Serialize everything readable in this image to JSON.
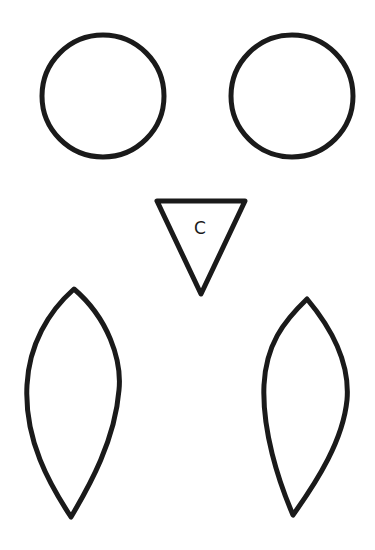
{
  "diagram": {
    "shapes": [
      {
        "id": "left-eye",
        "type": "circle",
        "cx": 103,
        "cy": 96,
        "r": 62
      },
      {
        "id": "right-eye",
        "type": "circle",
        "cx": 292,
        "cy": 96,
        "r": 62
      },
      {
        "id": "beak",
        "type": "triangle",
        "points": "157,201 245,201 201,294",
        "label": "C"
      },
      {
        "id": "left-wing",
        "type": "leaf"
      },
      {
        "id": "right-wing",
        "type": "leaf"
      }
    ],
    "beak_label": "C",
    "stroke_color": "#1a1a1a",
    "fill_color": "#ffffff"
  }
}
